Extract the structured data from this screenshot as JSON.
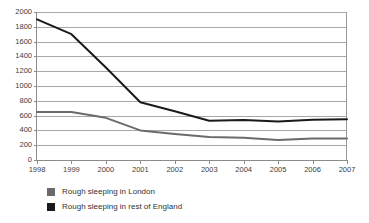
{
  "chart_data": {
    "type": "line",
    "title": "",
    "xlabel": "",
    "ylabel": "",
    "x": [
      "1998",
      "1999",
      "2000",
      "2001",
      "2002",
      "2003",
      "2004",
      "2005",
      "2006",
      "2007"
    ],
    "categories": [
      "1998",
      "1999",
      "2000",
      "2001",
      "2002",
      "2003",
      "2004",
      "2005",
      "2006",
      "2007"
    ],
    "ylim": [
      0,
      2000
    ],
    "ytick_labels": [
      "0",
      "200",
      "400",
      "600",
      "800",
      "1000",
      "1200",
      "1400",
      "1600",
      "1800",
      "2000"
    ],
    "ytick_values": [
      0,
      200,
      400,
      600,
      800,
      1000,
      1200,
      1400,
      1600,
      1800,
      2000
    ],
    "grid": true,
    "legend_position": "bottom-left",
    "series": [
      {
        "name": "Rough sleeping in London",
        "color": "#6b6b6b",
        "values": [
          650,
          650,
          570,
          400,
          350,
          310,
          300,
          270,
          290,
          290
        ]
      },
      {
        "name": "Rough sleeping in rest of England",
        "color": "#1a1a1a",
        "values": [
          1900,
          1700,
          1250,
          780,
          660,
          530,
          540,
          520,
          545,
          550
        ]
      }
    ]
  },
  "legend": {
    "items": [
      {
        "label": "Rough sleeping in London",
        "swatch": "#6b6b6b"
      },
      {
        "label": "Rough sleeping in rest of England",
        "swatch": "#1a1a1a"
      }
    ]
  },
  "colors": {
    "london": "#6b6b6b",
    "rest_of_england": "#1a1a1a",
    "gridline": "#a8a8a8",
    "axis": "#8c8c8c",
    "background": "#ffffff"
  }
}
